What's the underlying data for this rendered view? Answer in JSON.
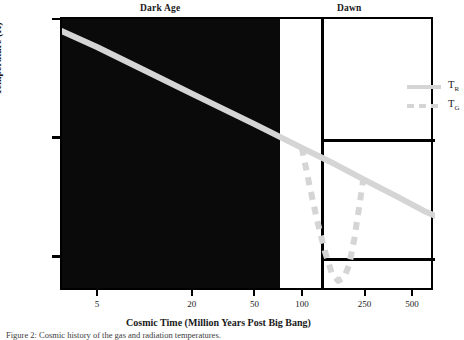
{
  "figure": {
    "sections": [
      {
        "id": "dark-age",
        "label": "Dark Age"
      },
      {
        "id": "dawn",
        "label": "Dawn"
      }
    ],
    "caption": "Figure 2: Cosmic history of the gas and radiation temperatures."
  },
  "axes": {
    "xtitle": "Cosmic Time (Million Years Post Big Bang)",
    "ytitle": "Temperature (K)",
    "xticks": [
      {
        "value": 5,
        "label": "5",
        "pos": 0.185
      },
      {
        "value": 20,
        "label": "20",
        "pos": 0.405
      },
      {
        "value": 50,
        "label": "50",
        "pos": 0.553
      },
      {
        "value": 100,
        "label": "100",
        "pos": 0.667
      },
      {
        "value": 250,
        "label": "250",
        "pos": 0.812
      },
      {
        "value": 500,
        "label": "500",
        "pos": 0.925
      }
    ],
    "yticks": [
      {
        "value": 1000,
        "mant": "10",
        "exp": "3",
        "pos": 0.0
      },
      {
        "value": 100,
        "mant": "10",
        "exp": "2",
        "pos": 0.447
      },
      {
        "value": 10,
        "mant": "10",
        "exp": "1",
        "pos": 0.894
      }
    ]
  },
  "legend": {
    "position": "top-right",
    "entries": [
      {
        "name": "T-R",
        "mant": "T",
        "sub": "R",
        "style": "solid",
        "color": "#d5d5d5"
      },
      {
        "name": "T-G",
        "mant": "T",
        "sub": "G",
        "style": "dashed",
        "color": "#d5d5d5"
      }
    ]
  },
  "colors": {
    "curve": "#d5d5d5",
    "darkage": "#0a0a0a",
    "frame": "#000000",
    "background": "#ffffff"
  },
  "chart_data": {
    "type": "line",
    "title": "",
    "xlabel": "Cosmic Time (Million Years Post Big Bang)",
    "ylabel": "Temperature (K)",
    "xscale": "log",
    "yscale": "log",
    "xlim": [
      3.0,
      700
    ],
    "ylim": [
      5.0,
      1000
    ],
    "grid": false,
    "legend_position": "top-right",
    "annotations": [
      {
        "text": "Dark Age",
        "x_range": [
          3.0,
          100
        ]
      },
      {
        "text": "Dawn",
        "x_range": [
          250,
          700
        ]
      }
    ],
    "series": [
      {
        "name": "T_R",
        "label": "T_R",
        "style": "solid",
        "color": "#d5d5d5",
        "x": [
          3.0,
          5,
          10,
          20,
          50,
          100,
          150,
          250,
          400,
          600,
          700
        ],
        "y": [
          790,
          580,
          370,
          235,
          130,
          82,
          63,
          44,
          32,
          24,
          22
        ]
      },
      {
        "name": "T_G",
        "label": "T_G",
        "style": "dashed",
        "color": "#d5d5d5",
        "x": [
          100,
          110,
          125,
          140,
          155,
          170,
          185,
          200,
          215,
          230,
          245
        ],
        "y": [
          82,
          44,
          20,
          11,
          7.2,
          6.2,
          6.6,
          8.5,
          14,
          25,
          44
        ]
      }
    ]
  }
}
